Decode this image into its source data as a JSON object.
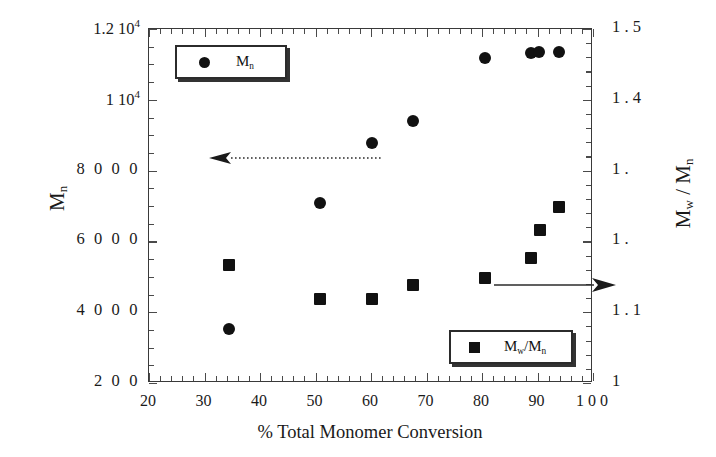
{
  "chart_data": {
    "type": "scatter",
    "title": "",
    "xlabel": "% Total Monomer Conversion",
    "ylabel": "M_n",
    "ylabel_right": "M_w / M_n",
    "xlim": [
      20,
      100
    ],
    "ylim_left": [
      2000,
      12000
    ],
    "ylim_right": [
      1.0,
      1.5
    ],
    "grid": false,
    "legend_position": [
      "top-left",
      "bottom-right"
    ],
    "x_ticks": [
      "20",
      "30",
      "40",
      "50",
      "60",
      "70",
      "80",
      "90",
      "1 0 0"
    ],
    "x_tick_values": [
      20,
      30,
      40,
      50,
      60,
      70,
      80,
      90,
      100
    ],
    "y_ticks_left": [
      "1.2 10",
      "1 10",
      "8 0 0 0",
      "6 0 0 0",
      "4 0 0 0",
      "2 0 0"
    ],
    "y_tick_values_left": [
      12000,
      10000,
      8000,
      6000,
      4000,
      2000
    ],
    "y_ticks_right": [
      "1 . 5",
      "1 . 4",
      "1 . 3",
      "1 . 2",
      "1 . 1",
      "1"
    ],
    "y_tick_values_right": [
      1.5,
      1.4,
      1.3,
      1.2,
      1.1,
      1.0
    ],
    "series": [
      {
        "name": "M_n",
        "marker": "circle",
        "axis": "left",
        "color": "#111111",
        "points": [
          {
            "x": 34.5,
            "y": 3520
          },
          {
            "x": 50.8,
            "y": 7080
          },
          {
            "x": 60.2,
            "y": 8780
          },
          {
            "x": 67.5,
            "y": 9390
          },
          {
            "x": 80.6,
            "y": 11170
          },
          {
            "x": 88.9,
            "y": 11330
          },
          {
            "x": 90.2,
            "y": 11350
          },
          {
            "x": 93.8,
            "y": 11350
          }
        ]
      },
      {
        "name": "M_w/M_n",
        "marker": "square",
        "axis": "right",
        "color": "#111111",
        "points": [
          {
            "x": 34.5,
            "y": 1.166
          },
          {
            "x": 50.8,
            "y": 1.118
          },
          {
            "x": 60.2,
            "y": 1.118
          },
          {
            "x": 67.5,
            "y": 1.138
          },
          {
            "x": 80.6,
            "y": 1.148
          },
          {
            "x": 88.9,
            "y": 1.176
          },
          {
            "x": 90.4,
            "y": 1.216
          },
          {
            "x": 93.8,
            "y": 1.248
          }
        ]
      }
    ],
    "annotations": [
      {
        "name": "left-axis-arrow",
        "style": "dotted",
        "direction": "left"
      },
      {
        "name": "right-axis-arrow",
        "style": "solid",
        "direction": "right"
      }
    ]
  },
  "axes": {
    "x_title": "% Total Monomer Conversion",
    "y_left_title_base": "M",
    "y_left_title_sub": "n",
    "y_right_title": "M",
    "y_right_sub_w": "w",
    "y_right_slash": " / ",
    "y_right_sub_n": "n"
  },
  "y_left_labels": [
    {
      "text": "1.2 10",
      "sup": "4",
      "value": 12000
    },
    {
      "text": "1 10",
      "sup": "4",
      "value": 10000
    },
    {
      "text": "8 0 0 0",
      "sup": "",
      "value": 8000
    },
    {
      "text": "6 0 0 0",
      "sup": "",
      "value": 6000
    },
    {
      "text": "4 0 0 0",
      "sup": "",
      "value": 4000
    },
    {
      "text": "2 0 0",
      "sup": "",
      "value": 2000
    }
  ],
  "y_right_labels": [
    {
      "text": "1  .    5",
      "value": 1.5
    },
    {
      "text": "1  .    4",
      "value": 1.4
    },
    {
      "text": "1  .",
      "value": 1.3
    },
    {
      "text": "1  .",
      "value": 1.2
    },
    {
      "text": "1  .    1",
      "value": 1.1
    },
    {
      "text": "1",
      "value": 1.0
    }
  ],
  "x_labels": [
    {
      "text": "20",
      "value": 20
    },
    {
      "text": "30",
      "value": 30
    },
    {
      "text": "40",
      "value": 40
    },
    {
      "text": "50",
      "value": 50
    },
    {
      "text": "60",
      "value": 60
    },
    {
      "text": "70",
      "value": 70
    },
    {
      "text": "80",
      "value": 80
    },
    {
      "text": "90",
      "value": 90
    },
    {
      "text": "1 0  0",
      "value": 100
    }
  ],
  "legends": {
    "mn": {
      "label_base": "M",
      "label_sub": "n",
      "marker": "circle-marker"
    },
    "pdi": {
      "label": "M",
      "sub_w": "w",
      "slash": "/M",
      "sub_n": "n",
      "marker": "square-marker"
    }
  },
  "colors": {
    "marker": "#111111",
    "frame": "#3a3a3a",
    "text": "#1a1a1a",
    "background": "#ffffff"
  }
}
